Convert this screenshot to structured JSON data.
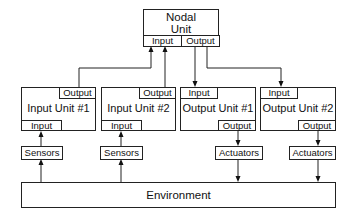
{
  "nodal_unit": {
    "title_line1": "Nodal",
    "title_line2": "Unit",
    "input": "Input",
    "output": "Output"
  },
  "input_units": [
    {
      "name": "Input Unit #1",
      "input": "Input",
      "output": "Output",
      "sensor": "Sensors"
    },
    {
      "name": "Input Unit #2",
      "input": "Input",
      "output": "Output",
      "sensor": "Sensors"
    }
  ],
  "output_units": [
    {
      "name": "Output Unit #1",
      "input": "Input",
      "output": "Output",
      "actuator": "Actuators"
    },
    {
      "name": "Output Unit #2",
      "input": "Input",
      "output": "Output",
      "actuator": "Actuators"
    }
  ],
  "environment": {
    "label": "Environment"
  }
}
